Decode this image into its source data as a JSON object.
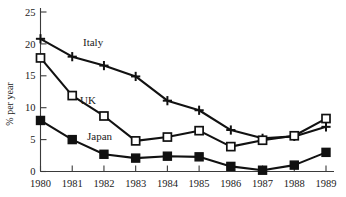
{
  "chart_data": {
    "type": "line",
    "title": "",
    "xlabel": "",
    "ylabel": "% per year",
    "x": [
      1980,
      1981,
      1982,
      1983,
      1984,
      1985,
      1986,
      1987,
      1988,
      1989
    ],
    "categories": [
      "1980",
      "1981",
      "1982",
      "1983",
      "1984",
      "1985",
      "1986",
      "1987",
      "1988",
      "1989"
    ],
    "xlim": [
      1980,
      1989
    ],
    "ylim": [
      0,
      25
    ],
    "yticks": [
      0,
      5,
      10,
      15,
      20,
      25
    ],
    "ytick_labels": [
      "0",
      "5",
      "10",
      "15",
      "20",
      "25"
    ],
    "grid": false,
    "legend": "inline-annotations",
    "series": [
      {
        "name": "Italy",
        "marker": "plus",
        "label_position": "inline",
        "values": [
          20.8,
          18.0,
          16.6,
          14.9,
          11.1,
          9.6,
          6.5,
          5.2,
          5.5,
          7.0
        ]
      },
      {
        "name": "UK",
        "marker": "open-square",
        "label_position": "inline",
        "values": [
          17.8,
          11.9,
          8.7,
          4.8,
          5.4,
          6.4,
          3.9,
          4.9,
          5.6,
          8.3
        ]
      },
      {
        "name": "Japan",
        "marker": "filled-square",
        "label_position": "inline",
        "values": [
          8.0,
          5.0,
          2.7,
          2.1,
          2.4,
          2.3,
          0.8,
          0.2,
          1.0,
          3.0
        ]
      }
    ],
    "annotations": [
      {
        "text": "Italy",
        "series": "Italy"
      },
      {
        "text": "UK",
        "series": "UK"
      },
      {
        "text": "Japan",
        "series": "Japan"
      }
    ],
    "colors": {
      "line": "#111111",
      "axis": "#3a3a3a",
      "background": "#ffffff",
      "marker_fill_open": "#ffffff",
      "marker_fill_closed": "#111111"
    }
  }
}
